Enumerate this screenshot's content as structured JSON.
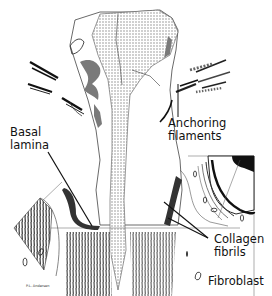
{
  "figure": {
    "labels": {
      "anchoring_filaments": [
        "Anchoring",
        "filaments"
      ],
      "basal_lamina": [
        "Basal",
        "lamina"
      ],
      "collagen_fibrils": [
        "Collagen",
        "fibrils"
      ],
      "fibroblast": "Fibroblast"
    },
    "signature": "P.L. Andersen",
    "colors": {
      "ink": "#111111",
      "stipple": "#9a9a9a",
      "shade": "#7a7a7a",
      "background": "#ffffff"
    }
  }
}
